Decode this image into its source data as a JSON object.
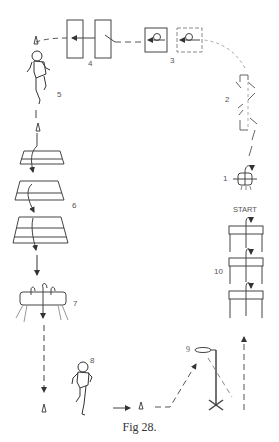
{
  "figure": {
    "caption": "Fig 28.",
    "start_label": "START"
  },
  "stations": [
    {
      "number": "1",
      "name": "small box / mat roll"
    },
    {
      "number": "2",
      "name": "zig-zag hurdles"
    },
    {
      "number": "3",
      "name": "forward roll mats"
    },
    {
      "number": "4",
      "name": "long mats"
    },
    {
      "number": "5",
      "name": "running figure"
    },
    {
      "number": "6",
      "name": "trapezoid box sections"
    },
    {
      "number": "7",
      "name": "pommel horse"
    },
    {
      "number": "8",
      "name": "running figure"
    },
    {
      "number": "9",
      "name": "basketball hoop"
    },
    {
      "number": "10",
      "name": "benches"
    }
  ],
  "colors": {
    "line": "#333333",
    "dashed": "#555555",
    "faint": "#999999",
    "text": "#555555"
  }
}
